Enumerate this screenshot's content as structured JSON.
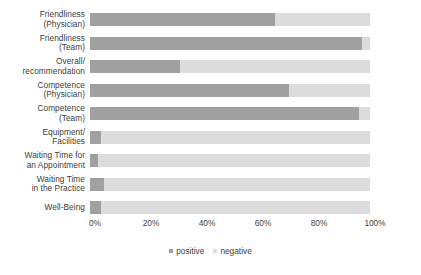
{
  "chart_data": {
    "type": "bar",
    "orientation": "horizontal",
    "stacked": true,
    "stack_total": 100,
    "title": "",
    "subtitle": "",
    "xlabel": "",
    "ylabel": "",
    "xlim": [
      0,
      100
    ],
    "xunit": "%",
    "grid": false,
    "legend_position": "bottom-center",
    "categories": [
      "Friendliness\n(Physician)",
      "Friendliness\n(Team)",
      "Overall/\nrecommendation",
      "Competence\n(Physician)",
      "Competence\n(Team)",
      "Equipment/\nFacilities",
      "Waiting Time for\nan Appointment",
      "Waiting Time\nin the Practice",
      "Well-Being"
    ],
    "series": [
      {
        "name": "positive",
        "color": "#a0a0a0",
        "values": [
          66,
          97,
          32,
          71,
          96,
          4,
          3,
          5,
          4
        ]
      },
      {
        "name": "negative",
        "color": "#dcdcdc",
        "values": [
          34,
          3,
          68,
          29,
          4,
          96,
          97,
          95,
          96
        ]
      }
    ],
    "xticks": [
      0,
      20,
      40,
      60,
      80,
      100
    ],
    "xticklabels": [
      "0%",
      "20%",
      "40%",
      "60%",
      "80%",
      "100%"
    ]
  },
  "legend": {
    "items": [
      {
        "label": "positive",
        "color": "#a0a0a0"
      },
      {
        "label": "negative",
        "color": "#dcdcdc"
      }
    ]
  },
  "colors": {
    "positive": "#a0a0a0",
    "negative": "#dcdcdc",
    "text": "#3d3d3d",
    "background": "#ffffff"
  }
}
